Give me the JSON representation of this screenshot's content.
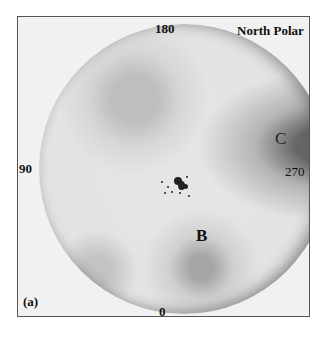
{
  "figure": {
    "title": "North Polar",
    "panel_label": "(a)",
    "angle_labels": {
      "top": "180",
      "left": "90",
      "right": "270",
      "bottom": "0"
    },
    "region_labels": {
      "b": "B",
      "c": "C"
    }
  }
}
